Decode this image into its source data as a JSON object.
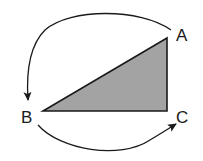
{
  "diagram": {
    "type": "triangle-rotation",
    "triangle": {
      "fill": "#a3a3a3",
      "stroke": "#1a1a1a",
      "vertices": {
        "A": [
          167,
          38
        ],
        "B": [
          43,
          111
        ],
        "C": [
          167,
          111
        ]
      }
    },
    "labels": {
      "A": "A",
      "B": "B",
      "C": "C"
    },
    "arrows": [
      {
        "from": "A",
        "to": "B",
        "direction": "counterclockwise-over-top"
      },
      {
        "from": "B",
        "to": "C",
        "direction": "counterclockwise-under-bottom"
      }
    ],
    "colors": {
      "line": "#1a1a1a",
      "fill": "#a3a3a3",
      "background": "#ffffff"
    }
  }
}
